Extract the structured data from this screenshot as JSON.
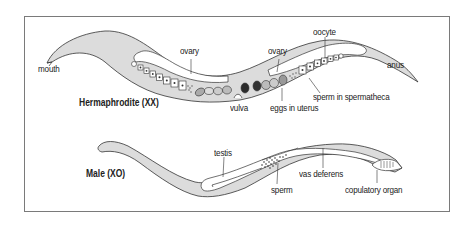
{
  "diagram": {
    "colors": {
      "border": "#7a7a7a",
      "body_fill": "#d9d9d9",
      "body_stroke": "#333333",
      "gonad_fill": "#ffffff",
      "egg_dark": "#2a2a2a",
      "egg_mid": "#8a8a8a"
    },
    "hermaphrodite": {
      "title": "Hermaphrodite (XX)",
      "labels": {
        "mouth": "mouth",
        "ovary_left": "ovary",
        "ovary_right": "ovary",
        "oocyte": "oocyte",
        "anus": "anus",
        "vulva": "vulva",
        "eggs_in_uterus": "eggs in uterus",
        "sperm_in_spermatheca": "sperm in spermatheca"
      }
    },
    "male": {
      "title": "Male (XO)",
      "labels": {
        "testis": "testis",
        "sperm": "sperm",
        "vas_deferens": "vas deferens",
        "copulatory_organ": "copulatory organ"
      }
    }
  }
}
